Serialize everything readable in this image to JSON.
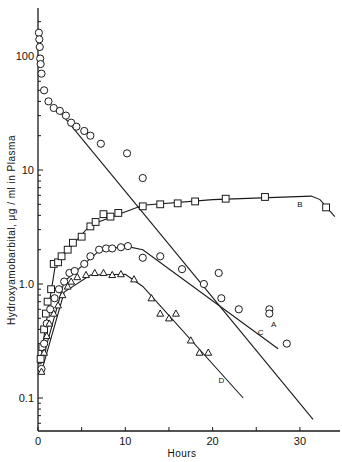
{
  "chart_data": {
    "type": "scatter",
    "title": "",
    "xlabel": "Hours",
    "ylabel": "Hydroxyamobarbital, μg / ml  in Plasma",
    "xlim": [
      0,
      35
    ],
    "ylim": [
      0.05,
      300
    ],
    "yscale": "log",
    "grid": false,
    "x_ticks": [
      0,
      5,
      10,
      15,
      20,
      25,
      30
    ],
    "x_tick_labels": [
      "0",
      "",
      "10",
      "",
      "20",
      "",
      "30"
    ],
    "y_tick_labels": [
      {
        "value": 100,
        "label": "100"
      },
      {
        "value": 10,
        "label": "10"
      },
      {
        "value": 1.0,
        "label": "1.0"
      },
      {
        "value": 0.1,
        "label": "0.1"
      }
    ],
    "series": [
      {
        "name": "A",
        "marker": "circle",
        "points": [
          [
            0.1,
            160
          ],
          [
            0.15,
            140
          ],
          [
            0.2,
            120
          ],
          [
            0.25,
            95
          ],
          [
            0.3,
            85
          ],
          [
            0.4,
            70
          ],
          [
            0.7,
            50
          ],
          [
            1.2,
            40
          ],
          [
            1.8,
            35
          ],
          [
            2.5,
            33
          ],
          [
            3.2,
            30
          ],
          [
            3.8,
            26
          ],
          [
            4.4,
            24
          ],
          [
            5.3,
            22
          ],
          [
            6.0,
            20
          ],
          [
            7.2,
            17
          ],
          [
            10.2,
            14
          ],
          [
            12.0,
            8.5
          ],
          [
            20.7,
            1.25
          ],
          [
            26.5,
            0.6
          ]
        ],
        "fit_line": [
          [
            2.0,
            36
          ],
          [
            31.5,
            0.065
          ]
        ],
        "label_at": [
          27.0,
          0.45
        ]
      },
      {
        "name": "B",
        "marker": "square",
        "points": [
          [
            0.3,
            0.22
          ],
          [
            0.5,
            0.28
          ],
          [
            0.7,
            0.4
          ],
          [
            0.9,
            0.55
          ],
          [
            1.1,
            0.7
          ],
          [
            1.5,
            0.9
          ],
          [
            1.8,
            1.5
          ],
          [
            2.3,
            1.55
          ],
          [
            2.7,
            1.75
          ],
          [
            3.4,
            2.0
          ],
          [
            4.0,
            2.3
          ],
          [
            5.0,
            2.6
          ],
          [
            6.0,
            3.2
          ],
          [
            6.6,
            3.5
          ],
          [
            7.5,
            4.1
          ],
          [
            8.3,
            3.9
          ],
          [
            9.2,
            4.2
          ],
          [
            12.0,
            4.8
          ],
          [
            14.0,
            5.0
          ],
          [
            16.0,
            5.1
          ],
          [
            18.0,
            5.3
          ],
          [
            21.5,
            5.6
          ],
          [
            26.0,
            5.8
          ],
          [
            33.0,
            4.7
          ]
        ],
        "fit_line": [
          [
            0.4,
            0.25
          ],
          [
            2.0,
            1.5
          ],
          [
            6,
            3.3
          ],
          [
            12,
            4.9
          ],
          [
            20,
            5.5
          ],
          [
            31.3,
            5.9
          ],
          [
            32.3,
            5.5
          ],
          [
            34,
            3.9
          ]
        ],
        "label_at": [
          30.0,
          5.0
        ]
      },
      {
        "name": "C",
        "marker": "circle",
        "points": [
          [
            0.4,
            0.18
          ],
          [
            0.7,
            0.3
          ],
          [
            1.0,
            0.45
          ],
          [
            1.4,
            0.6
          ],
          [
            1.9,
            0.75
          ],
          [
            2.4,
            0.9
          ],
          [
            3.0,
            1.05
          ],
          [
            3.6,
            1.25
          ],
          [
            4.2,
            1.3
          ],
          [
            5.3,
            1.5
          ],
          [
            6.0,
            1.75
          ],
          [
            7.0,
            2.0
          ],
          [
            7.8,
            2.05
          ],
          [
            8.5,
            2.05
          ],
          [
            9.5,
            2.1
          ],
          [
            10.3,
            2.15
          ],
          [
            12.0,
            1.7
          ],
          [
            14.0,
            1.75
          ],
          [
            16.5,
            1.35
          ],
          [
            19.0,
            1.0
          ],
          [
            21.0,
            0.75
          ],
          [
            23.0,
            0.6
          ],
          [
            26.5,
            0.55
          ],
          [
            28.5,
            0.3
          ]
        ],
        "fit_line": [
          [
            0.4,
            0.2
          ],
          [
            3,
            1.05
          ],
          [
            7,
            1.95
          ],
          [
            10,
            2.15
          ],
          [
            12,
            2.0
          ],
          [
            27.5,
            0.27
          ]
        ],
        "label_at": [
          25.5,
          0.38
        ]
      },
      {
        "name": "D",
        "marker": "triangle",
        "points": [
          [
            0.4,
            0.17
          ],
          [
            0.7,
            0.25
          ],
          [
            1.0,
            0.35
          ],
          [
            1.3,
            0.45
          ],
          [
            1.8,
            0.55
          ],
          [
            2.3,
            0.65
          ],
          [
            2.8,
            0.8
          ],
          [
            3.4,
            0.95
          ],
          [
            3.8,
            1.05
          ],
          [
            4.5,
            1.15
          ],
          [
            5.5,
            1.2
          ],
          [
            6.5,
            1.25
          ],
          [
            7.5,
            1.25
          ],
          [
            8.5,
            1.2
          ],
          [
            9.5,
            1.22
          ],
          [
            11.0,
            1.1
          ],
          [
            13.0,
            0.75
          ],
          [
            14.0,
            0.55
          ],
          [
            15.0,
            0.5
          ],
          [
            15.8,
            0.55
          ],
          [
            17.5,
            0.32
          ],
          [
            18.5,
            0.25
          ],
          [
            19.5,
            0.25
          ]
        ],
        "fit_line": [
          [
            0.4,
            0.17
          ],
          [
            3,
            0.85
          ],
          [
            6,
            1.2
          ],
          [
            10,
            1.22
          ],
          [
            12,
            0.95
          ],
          [
            23.5,
            0.1
          ]
        ],
        "label_at": [
          21.0,
          0.145
        ]
      }
    ]
  }
}
